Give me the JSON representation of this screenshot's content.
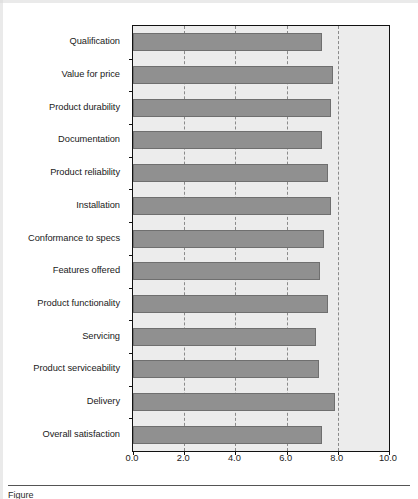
{
  "chart_data": {
    "type": "bar",
    "orientation": "horizontal",
    "title": "",
    "subtitle": "",
    "xlabel": "",
    "ylabel": "",
    "xlim": [
      0.0,
      10.0
    ],
    "xticks": [
      "0.0",
      "2.0",
      "4.0",
      "6.0",
      "8.0",
      "10.0"
    ],
    "xtick_values": [
      0.0,
      2.0,
      4.0,
      6.0,
      8.0,
      10.0
    ],
    "grid": "vertical-dashed",
    "gridline_values": [
      2.0,
      4.0,
      6.0,
      8.0
    ],
    "legend": null,
    "legend_position": "none",
    "categories": [
      "Qualification",
      "Value for price",
      "Product durability",
      "Documentation",
      "Product reliability",
      "Installation",
      "Conformance to specs",
      "Features offered",
      "Product functionality",
      "Servicing",
      "Product serviceability",
      "Delivery",
      "Overall satisfaction"
    ],
    "values": [
      7.4,
      7.8,
      7.75,
      7.4,
      7.6,
      7.75,
      7.45,
      7.3,
      7.6,
      7.15,
      7.25,
      7.9,
      7.4
    ],
    "series": [
      {
        "name": "Mean rating",
        "values": [
          7.4,
          7.8,
          7.75,
          7.4,
          7.6,
          7.75,
          7.45,
          7.3,
          7.6,
          7.15,
          7.25,
          7.9,
          7.4
        ]
      }
    ]
  },
  "style": {
    "bar_fill": "#909090",
    "bar_border": "#6f6f6f",
    "plot_background": "#ececec",
    "plot_border": "#111111",
    "gridline_color": "#8a8a8a",
    "text_color": "#1a1a1a",
    "page_background": "#ffffff"
  },
  "caption": {
    "prefix": "Figure",
    "text": ""
  }
}
